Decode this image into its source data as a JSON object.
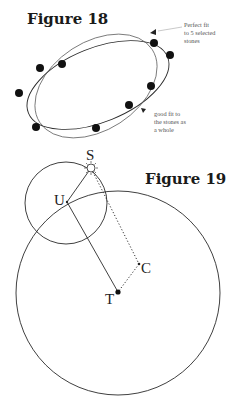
{
  "figure18": {
    "title": "Figure 18",
    "annotation_top": [
      "Perfect fit",
      "to 5 selected",
      "stones"
    ],
    "annotation_bottom": [
      "good fit to",
      "the stones as",
      "a whole"
    ],
    "stones": [
      {
        "x": 40,
        "y": 68
      },
      {
        "x": 62,
        "y": 64
      },
      {
        "x": 19,
        "y": 93
      },
      {
        "x": 36,
        "y": 127
      },
      {
        "x": 96,
        "y": 128
      },
      {
        "x": 129,
        "y": 105
      },
      {
        "x": 151,
        "y": 86
      },
      {
        "x": 154,
        "y": 43
      },
      {
        "x": 170,
        "y": 55
      }
    ]
  },
  "figure19": {
    "title": "Figure 19",
    "labels": {
      "S": "S",
      "U": "U",
      "C": "C",
      "T": "T"
    }
  }
}
